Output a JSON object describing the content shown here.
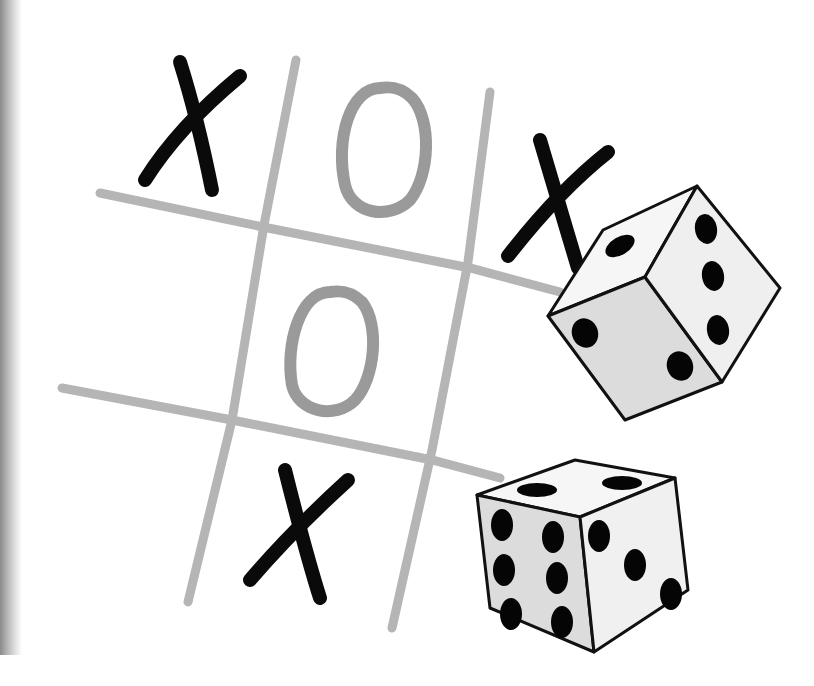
{
  "image": {
    "subject": "tic-tac-toe board with two dice",
    "colors": {
      "background": "#ffffff",
      "grid_line": "#b5b5b5",
      "o_mark": "#9a9a9a",
      "x_mark": "#0a0a0a",
      "die_face": "#f4f4f4",
      "die_shade": "#dcdcdc",
      "die_outline": "#111111",
      "pip": "#050505"
    },
    "board": {
      "cells": [
        [
          "X",
          "O",
          "X"
        ],
        [
          "",
          "O",
          ""
        ],
        [
          "",
          "X",
          ""
        ]
      ]
    },
    "dice": [
      {
        "name": "upper-die",
        "visible_faces": {
          "top": 1,
          "front": 2,
          "right": 4
        }
      },
      {
        "name": "lower-die",
        "visible_faces": {
          "top": 2,
          "front": 6,
          "right": 3
        }
      }
    ]
  }
}
